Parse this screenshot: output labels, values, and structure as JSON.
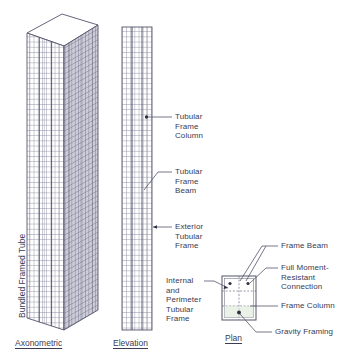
{
  "figure": {
    "background_color": "#ffffff",
    "text_color": "#3b3b52",
    "line_color": "#55556b",
    "grid_color": "#8a8aa0",
    "shade_color": "#a9a9bb"
  },
  "vertical_label": {
    "text": "Bundled Framed Tube"
  },
  "captions": {
    "axonometric": "Axonometric",
    "elevation": "Elevation",
    "plan": "Plan"
  },
  "annotations": {
    "tubular_frame_column": "Tubular\nFrame\nColumn",
    "tubular_frame_beam": "Tubular\nFrame\nBeam",
    "exterior_tubular_frame": "Exterior\nTubular\nFrame",
    "internal_and_perimeter_tubular_frame": "Internal\nand\nPerimeter\nTubular\nFrame",
    "frame_beam": "Frame Beam",
    "full_moment_resistant_connection": "Full Moment-\nResistant\nConnection",
    "frame_column": "Frame Column",
    "gravity_framing": "Gravity Framing"
  },
  "views": {
    "axonometric": {
      "name": "Axonometric",
      "description": "Extruded rectangular tower with gridded front face, shaded right face and white top face"
    },
    "elevation": {
      "name": "Elevation",
      "description": "Flat gridded rectangular tower facade"
    },
    "plan": {
      "name": "Plan",
      "description": "Rectangular floor plate subdivided by dashed grid lines with column nodes"
    }
  }
}
